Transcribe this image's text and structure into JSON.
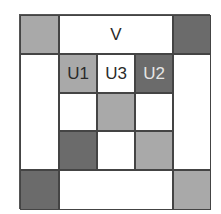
{
  "diagram": {
    "colors": {
      "white": "#ffffff",
      "light": "#a9a9a9",
      "dark": "#6b6b6b",
      "line": "#444444"
    },
    "cells": [
      {
        "id": "top-left-corner",
        "shade": "light",
        "label": "",
        "row": 1,
        "col": 1,
        "rowspan": 1,
        "colspan": 1
      },
      {
        "id": "top-span",
        "shade": "white",
        "label": "V",
        "row": 1,
        "col": 2,
        "rowspan": 1,
        "colspan": 3
      },
      {
        "id": "top-right-corner",
        "shade": "dark",
        "label": "",
        "row": 1,
        "col": 5,
        "rowspan": 1,
        "colspan": 1
      },
      {
        "id": "left-span",
        "shade": "white",
        "label": "",
        "row": 2,
        "col": 1,
        "rowspan": 3,
        "colspan": 1
      },
      {
        "id": "inner-r1c1",
        "shade": "light",
        "label": "U1",
        "row": 2,
        "col": 2,
        "rowspan": 1,
        "colspan": 1
      },
      {
        "id": "inner-r1c2",
        "shade": "white",
        "label": "U3",
        "row": 2,
        "col": 3,
        "rowspan": 1,
        "colspan": 1
      },
      {
        "id": "inner-r1c3",
        "shade": "dark",
        "label": "U2",
        "row": 2,
        "col": 4,
        "rowspan": 1,
        "colspan": 1
      },
      {
        "id": "right-span",
        "shade": "white",
        "label": "",
        "row": 2,
        "col": 5,
        "rowspan": 3,
        "colspan": 1
      },
      {
        "id": "inner-r2c1",
        "shade": "white",
        "label": "",
        "row": 3,
        "col": 2,
        "rowspan": 1,
        "colspan": 1
      },
      {
        "id": "inner-r2c2",
        "shade": "light",
        "label": "",
        "row": 3,
        "col": 3,
        "rowspan": 1,
        "colspan": 1
      },
      {
        "id": "inner-r2c3",
        "shade": "white",
        "label": "",
        "row": 3,
        "col": 4,
        "rowspan": 1,
        "colspan": 1
      },
      {
        "id": "inner-r3c1",
        "shade": "dark",
        "label": "",
        "row": 4,
        "col": 2,
        "rowspan": 1,
        "colspan": 1
      },
      {
        "id": "inner-r3c2",
        "shade": "white",
        "label": "",
        "row": 4,
        "col": 3,
        "rowspan": 1,
        "colspan": 1
      },
      {
        "id": "inner-r3c3",
        "shade": "light",
        "label": "",
        "row": 4,
        "col": 4,
        "rowspan": 1,
        "colspan": 1
      },
      {
        "id": "bottom-left-corner",
        "shade": "dark",
        "label": "",
        "row": 5,
        "col": 1,
        "rowspan": 1,
        "colspan": 1
      },
      {
        "id": "bottom-span",
        "shade": "white",
        "label": "",
        "row": 5,
        "col": 2,
        "rowspan": 1,
        "colspan": 3
      },
      {
        "id": "bottom-right-corner",
        "shade": "light",
        "label": "",
        "row": 5,
        "col": 5,
        "rowspan": 1,
        "colspan": 1
      }
    ]
  }
}
